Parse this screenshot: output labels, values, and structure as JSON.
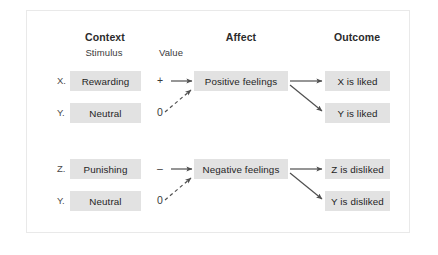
{
  "figure": {
    "title_columns": [
      {
        "label": "Context",
        "x": 105,
        "y": 37
      },
      {
        "label": "Affect",
        "x": 241,
        "y": 37
      },
      {
        "label": "Outcome",
        "x": 357,
        "y": 37
      }
    ],
    "sub_headers": [
      {
        "label": "Stimulus",
        "x": 103,
        "y": 53
      },
      {
        "label": "Value",
        "x": 170,
        "y": 53
      }
    ],
    "row_labels": [
      {
        "label": "X.",
        "x": 58,
        "y": 76
      },
      {
        "label": "Y.",
        "x": 58,
        "y": 108
      },
      {
        "label": "Z.",
        "x": 58,
        "y": 164
      },
      {
        "label": "Y.",
        "x": 58,
        "y": 196
      }
    ],
    "stimulus_boxes": [
      {
        "label": "Rewarding",
        "x": 70,
        "y": 71,
        "w": 71,
        "h": 20
      },
      {
        "label": "Neutral",
        "x": 70,
        "y": 103,
        "w": 71,
        "h": 20
      },
      {
        "label": "Punishing",
        "x": 70,
        "y": 159,
        "w": 71,
        "h": 20
      },
      {
        "label": "Neutral",
        "x": 70,
        "y": 191,
        "w": 71,
        "h": 20
      }
    ],
    "value_marks": [
      {
        "label": "+",
        "x": 160,
        "y": 75
      },
      {
        "label": "0",
        "x": 160,
        "y": 107
      },
      {
        "label": "–",
        "x": 160,
        "y": 163
      },
      {
        "label": "0",
        "x": 160,
        "y": 195
      }
    ],
    "affect_boxes": [
      {
        "label": "Positive feelings",
        "x": 194,
        "y": 71,
        "w": 94,
        "h": 20
      },
      {
        "label": "Negative feelings",
        "x": 194,
        "y": 159,
        "w": 94,
        "h": 20
      }
    ],
    "outcome_boxes": [
      {
        "label": "X is liked",
        "x": 325,
        "y": 71,
        "w": 65,
        "h": 20
      },
      {
        "label": "Y is liked",
        "x": 325,
        "y": 103,
        "w": 65,
        "h": 20
      },
      {
        "label": "Z is disliked",
        "x": 325,
        "y": 159,
        "w": 65,
        "h": 20
      },
      {
        "label": "Y is disliked",
        "x": 325,
        "y": 191,
        "w": 65,
        "h": 20
      }
    ],
    "connectors": [
      {
        "name": "rewarding-to-positive",
        "style": "solid",
        "x1": 171,
        "y1": 81,
        "x2": 192,
        "y2": 81
      },
      {
        "name": "neutral-to-positive",
        "style": "dashed",
        "x1": 165,
        "y1": 112,
        "x2": 191,
        "y2": 90
      },
      {
        "name": "positive-to-x-is-liked",
        "style": "solid",
        "x1": 290,
        "y1": 81,
        "x2": 322,
        "y2": 81
      },
      {
        "name": "positive-to-y-is-liked",
        "style": "solid",
        "x1": 290,
        "y1": 85,
        "x2": 322,
        "y2": 111
      },
      {
        "name": "punishing-to-negative",
        "style": "solid",
        "x1": 171,
        "y1": 169,
        "x2": 192,
        "y2": 169
      },
      {
        "name": "neutral-to-negative",
        "style": "dashed",
        "x1": 165,
        "y1": 200,
        "x2": 191,
        "y2": 178
      },
      {
        "name": "negative-to-z-is-disliked",
        "style": "solid",
        "x1": 290,
        "y1": 169,
        "x2": 322,
        "y2": 169
      },
      {
        "name": "negative-to-y-is-disliked",
        "style": "solid",
        "x1": 290,
        "y1": 173,
        "x2": 322,
        "y2": 199
      }
    ],
    "colors": {
      "box_fill": "#e2e2e2",
      "box_text": "#1f1f1f",
      "arrow": "#4f4f4f",
      "frame_border": "#e9e9e9",
      "background": "#ffffff"
    }
  }
}
